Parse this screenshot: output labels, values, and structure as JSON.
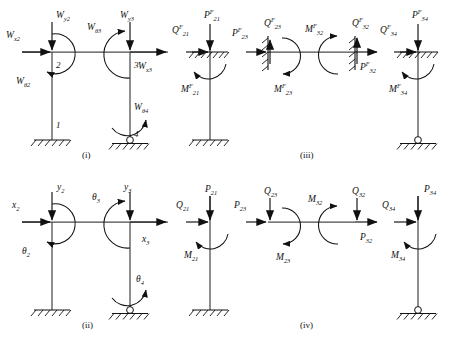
{
  "figure": {
    "captions": [
      {
        "id": "caption-i",
        "text": "(i)"
      },
      {
        "id": "caption-ii",
        "text": "(ii)"
      },
      {
        "id": "caption-iii",
        "text": "(iii)"
      },
      {
        "id": "caption-iv",
        "text": "(iv)"
      }
    ],
    "colors": {
      "member": "#4a4a4a",
      "ink": "#111111",
      "background": "#ffffff"
    }
  },
  "panel_i": {
    "caption": "(i)",
    "node_labels": [
      {
        "name": "node-1",
        "text": "1"
      },
      {
        "name": "node-2",
        "text": "2"
      },
      {
        "name": "node-3",
        "text": "3"
      },
      {
        "name": "node-4",
        "text": "4"
      }
    ],
    "load_labels": [
      {
        "name": "label-Wx2",
        "base": "W",
        "sub": "x2"
      },
      {
        "name": "label-Wy2",
        "base": "W",
        "sub": "y2"
      },
      {
        "name": "label-Wtheta2",
        "base": "W",
        "sub": "θ2"
      },
      {
        "name": "label-Wtheta3",
        "base": "W",
        "sub": "θ3"
      },
      {
        "name": "label-Wy3",
        "base": "W",
        "sub": "y3"
      },
      {
        "name": "label-Wx3",
        "base": "W",
        "sub": "x3"
      },
      {
        "name": "label-Wtheta4",
        "base": "W",
        "sub": "θ4"
      }
    ]
  },
  "panel_ii": {
    "caption": "(ii)",
    "dof_labels": [
      {
        "name": "label-x2",
        "base": "x",
        "sub": "2"
      },
      {
        "name": "label-y2",
        "base": "y",
        "sub": "2"
      },
      {
        "name": "label-theta2",
        "base": "θ",
        "sub": "2"
      },
      {
        "name": "label-theta3",
        "base": "θ",
        "sub": "3"
      },
      {
        "name": "label-y3",
        "base": "y",
        "sub": "3"
      },
      {
        "name": "label-x3",
        "base": "x",
        "sub": "3"
      },
      {
        "name": "label-theta4",
        "base": "θ",
        "sub": "4"
      }
    ]
  },
  "panel_iii": {
    "caption": "(iii)",
    "member_21": [
      {
        "name": "label-Q21F",
        "base": "Q",
        "sup": "F",
        "sub": "21"
      },
      {
        "name": "label-P21F",
        "base": "P",
        "sup": "F",
        "sub": "21"
      },
      {
        "name": "label-M21F",
        "base": "M",
        "sup": "F",
        "sub": "21"
      }
    ],
    "member_23": [
      {
        "name": "label-P23F",
        "base": "P",
        "sup": "F",
        "sub": "23"
      },
      {
        "name": "label-Q23F",
        "base": "Q",
        "sup": "F",
        "sub": "23"
      },
      {
        "name": "label-M23F",
        "base": "M",
        "sup": "F",
        "sub": "23"
      },
      {
        "name": "label-M32F",
        "base": "M",
        "sup": "F",
        "sub": "32"
      },
      {
        "name": "label-Q32F",
        "base": "Q",
        "sup": "F",
        "sub": "32"
      },
      {
        "name": "label-P32F",
        "base": "P",
        "sup": "F",
        "sub": "32"
      }
    ],
    "member_34": [
      {
        "name": "label-Q34F",
        "base": "Q",
        "sup": "F",
        "sub": "34"
      },
      {
        "name": "label-P34F",
        "base": "P",
        "sup": "F",
        "sub": "34"
      },
      {
        "name": "label-M34F",
        "base": "M",
        "sup": "F",
        "sub": "34"
      }
    ]
  },
  "panel_iv": {
    "caption": "(iv)",
    "member_21": [
      {
        "name": "label-Q21",
        "base": "Q",
        "sub": "21"
      },
      {
        "name": "label-P21",
        "base": "P",
        "sub": "21"
      },
      {
        "name": "label-M21",
        "base": "M",
        "sub": "21"
      }
    ],
    "member_23": [
      {
        "name": "label-P23",
        "base": "P",
        "sub": "23"
      },
      {
        "name": "label-Q23",
        "base": "Q",
        "sub": "23"
      },
      {
        "name": "label-M23",
        "base": "M",
        "sub": "23"
      },
      {
        "name": "label-M32",
        "base": "M",
        "sub": "32"
      },
      {
        "name": "label-Q32",
        "base": "Q",
        "sub": "32"
      },
      {
        "name": "label-P32",
        "base": "P",
        "sub": "32"
      }
    ],
    "member_34": [
      {
        "name": "label-Q34",
        "base": "Q",
        "sub": "34"
      },
      {
        "name": "label-P34",
        "base": "P",
        "sub": "34"
      },
      {
        "name": "label-M34",
        "base": "M",
        "sub": "34"
      }
    ]
  }
}
